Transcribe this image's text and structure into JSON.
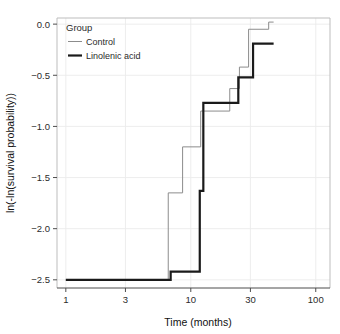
{
  "chart_data": {
    "type": "line",
    "title": "",
    "subtitle": "",
    "xlabel": "Time (months)",
    "ylabel": "ln(-ln(survival probability))",
    "xscale": "log",
    "xlim": [
      0.85,
      130
    ],
    "ylim": [
      -2.58,
      0.06
    ],
    "xticks": [
      1,
      3,
      10,
      30,
      100
    ],
    "xtick_labels": [
      "1",
      "3",
      "10",
      "30",
      "100"
    ],
    "yticks": [
      0.0,
      -0.5,
      -1.0,
      -1.5,
      -2.0,
      -2.5
    ],
    "ytick_labels": [
      "0.0",
      "-0.5",
      "-1.0",
      "-1.5",
      "-2.0",
      "-2.5"
    ],
    "grid": true,
    "grid_color": "#ebebeb",
    "panel_border_color": "#bdbdbd",
    "background": "#ffffff",
    "legend": {
      "title": "Group",
      "position": "top-left-inside",
      "entries": [
        {
          "name": "Control",
          "color": "#8c8c8c",
          "linewidth": 1.0
        },
        {
          "name": "Linolenic acid",
          "color": "#1a1a1a",
          "linewidth": 2.2
        }
      ]
    },
    "series": [
      {
        "name": "Control",
        "color": "#8c8c8c",
        "linewidth": 1.0,
        "step": "post",
        "points": [
          {
            "x": 1.0,
            "y": -2.5
          },
          {
            "x": 6.6,
            "y": -2.5
          },
          {
            "x": 6.6,
            "y": -1.65
          },
          {
            "x": 8.6,
            "y": -1.65
          },
          {
            "x": 8.6,
            "y": -1.2
          },
          {
            "x": 12.0,
            "y": -1.2
          },
          {
            "x": 12.0,
            "y": -0.85
          },
          {
            "x": 20.5,
            "y": -0.85
          },
          {
            "x": 20.5,
            "y": -0.63
          },
          {
            "x": 24.5,
            "y": -0.63
          },
          {
            "x": 24.5,
            "y": -0.42
          },
          {
            "x": 29.0,
            "y": -0.42
          },
          {
            "x": 29.0,
            "y": -0.05
          },
          {
            "x": 42.0,
            "y": -0.05
          },
          {
            "x": 42.0,
            "y": 0.02
          },
          {
            "x": 46.0,
            "y": 0.02
          }
        ]
      },
      {
        "name": "Linolenic acid",
        "color": "#1a1a1a",
        "linewidth": 2.2,
        "step": "post",
        "points": [
          {
            "x": 1.0,
            "y": -2.5
          },
          {
            "x": 6.9,
            "y": -2.5
          },
          {
            "x": 6.9,
            "y": -2.42
          },
          {
            "x": 11.8,
            "y": -2.42
          },
          {
            "x": 11.8,
            "y": -1.63
          },
          {
            "x": 12.6,
            "y": -1.63
          },
          {
            "x": 12.6,
            "y": -0.77
          },
          {
            "x": 24.0,
            "y": -0.77
          },
          {
            "x": 24.0,
            "y": -0.52
          },
          {
            "x": 31.5,
            "y": -0.52
          },
          {
            "x": 31.5,
            "y": -0.19
          },
          {
            "x": 46.0,
            "y": -0.19
          }
        ]
      }
    ]
  }
}
